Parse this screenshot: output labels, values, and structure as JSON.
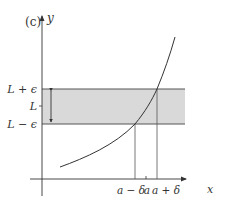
{
  "figure": {
    "panel_label": "(c)",
    "y_axis_label": "y",
    "x_axis_label": "x",
    "y_ticks": [
      {
        "label": "L + ϵ",
        "meaning": "upper bound of band"
      },
      {
        "label": "L",
        "meaning": "limit value"
      },
      {
        "label": "L − ϵ",
        "meaning": "lower bound of band"
      }
    ],
    "x_ticks": [
      {
        "label": "a − δ",
        "meaning": "left bound of interval"
      },
      {
        "label": "a",
        "meaning": "point a"
      },
      {
        "label": "a + δ",
        "meaning": "right bound of interval"
      }
    ],
    "colors": {
      "band_fill": "#d9d9d9",
      "band_edge": "#555555",
      "axis": "#333333",
      "curve": "#333333",
      "text": "#333333"
    }
  }
}
